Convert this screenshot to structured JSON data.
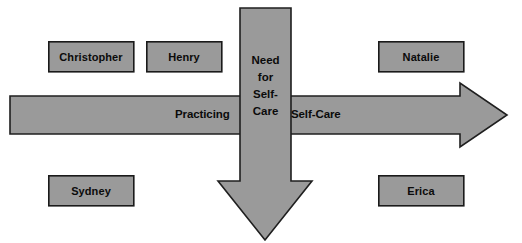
{
  "diagram": {
    "type": "cross-arrow-diagram",
    "canvas": {
      "width": 522,
      "height": 243,
      "background": "#ffffff"
    },
    "palette": {
      "shape_fill": "#9a9a9a",
      "shape_stroke": "#1a1a1a",
      "text": "#0b0b0b",
      "page_background": "#ffffff"
    },
    "horizontal_arrow": {
      "name": "practicing-self-care-arrow",
      "direction": "right",
      "labels": {
        "left": "Practicing",
        "right": "Self-Care"
      },
      "geometry": {
        "x": 10,
        "y": 83,
        "width": 498,
        "height": 64,
        "shaft_top": 96,
        "shaft_bottom": 134,
        "tip_x": 508
      }
    },
    "vertical_arrow": {
      "name": "need-for-self-care-arrow",
      "direction": "down",
      "label_lines": [
        "Need",
        "for",
        "Self-",
        "Care"
      ],
      "label_text": "Need for Self-Care",
      "geometry": {
        "x": 218,
        "y": 8,
        "width": 94,
        "height": 232,
        "shaft_left": 240,
        "shaft_right": 291,
        "tip_y": 240
      }
    },
    "boxes": [
      {
        "name": "box-christopher",
        "label": "Christopher",
        "quadrant": "top-left",
        "x": 48,
        "y": 41,
        "width": 86,
        "height": 31
      },
      {
        "name": "box-henry",
        "label": "Henry",
        "quadrant": "top-center",
        "x": 146,
        "y": 41,
        "width": 76,
        "height": 31
      },
      {
        "name": "box-natalie",
        "label": "Natalie",
        "quadrant": "top-right",
        "x": 378,
        "y": 41,
        "width": 86,
        "height": 31
      },
      {
        "name": "box-sydney",
        "label": "Sydney",
        "quadrant": "bottom-left",
        "x": 48,
        "y": 175,
        "width": 86,
        "height": 31
      },
      {
        "name": "box-erica",
        "label": "Erica",
        "quadrant": "bottom-right",
        "x": 378,
        "y": 175,
        "width": 86,
        "height": 31
      }
    ]
  }
}
